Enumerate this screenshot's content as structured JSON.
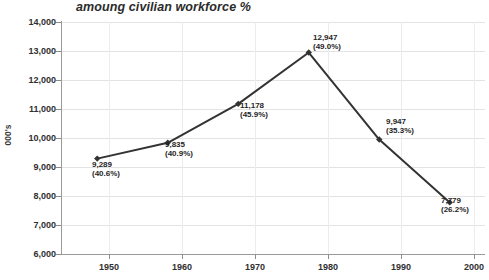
{
  "chart_data": {
    "type": "line",
    "title": "amoung civilian workforce %",
    "xlabel": "",
    "ylabel": "000's",
    "x": [
      1950,
      1960,
      1970,
      1980,
      1990,
      2000
    ],
    "categories": [
      "1950",
      "1960",
      "1970",
      "1980",
      "1990",
      "2000"
    ],
    "values": [
      9289,
      9835,
      11178,
      12947,
      9947,
      7779
    ],
    "series": [
      {
        "name": "civilian workforce",
        "values": [
          9289,
          9835,
          11178,
          12947,
          9947,
          7779
        ],
        "percent_labels": [
          "(40.6%)",
          "(40.9%)",
          "(45.9%)",
          "(49.0%)",
          "(35.3%)",
          "(26.2%)"
        ],
        "value_labels": [
          "9,289",
          "9,835",
          "11,178",
          "12,947",
          "9,947",
          "7,779"
        ],
        "color": "#333333"
      }
    ],
    "ylim": [
      6000,
      14000
    ],
    "xlim": [
      1945,
      2005
    ],
    "ytick_labels": [
      "14,000",
      "13,000",
      "12,000",
      "11,000",
      "10,000",
      "9,000",
      "8,000",
      "7,000",
      "6,000"
    ],
    "ytick_values": [
      14000,
      13000,
      12000,
      11000,
      10000,
      9000,
      8000,
      7000,
      6000
    ],
    "xtick_labels": [
      "1950",
      "1960",
      "1970",
      "1980",
      "1990",
      "2000"
    ],
    "grid": true,
    "legend": false,
    "background": "#ffffff"
  },
  "points": [
    {
      "value_label": "9,289",
      "pct_label": "(40.6%)"
    },
    {
      "value_label": "9,835",
      "pct_label": "(40.9%)"
    },
    {
      "value_label": "11,178",
      "pct_label": "(45.9%)"
    },
    {
      "value_label": "12,947",
      "pct_label": "(49.0%)"
    },
    {
      "value_label": "9,947",
      "pct_label": "(35.3%)"
    },
    {
      "value_label": "7,779",
      "pct_label": "(26.2%)"
    }
  ],
  "ticks": {
    "y": [
      "14,000",
      "13,000",
      "12,000",
      "11,000",
      "10,000",
      "9,000",
      "8,000",
      "7,000",
      "6,000"
    ],
    "x": [
      "1950",
      "1960",
      "1970",
      "1980",
      "1990",
      "2000"
    ]
  }
}
